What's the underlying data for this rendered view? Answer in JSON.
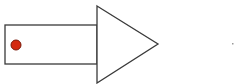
{
  "diagram": {
    "shape": "arrow",
    "colors": {
      "stroke": "#3a3a3a",
      "fill": "#ffffff",
      "dot_fill": "#d42a10",
      "dot_stroke": "#7a1a0a",
      "speck": "#9a9a9a"
    },
    "shaft": {
      "x": 5,
      "y": 25,
      "width": 92,
      "height": 39
    },
    "head": {
      "points": "97,6 158,44 97,83"
    },
    "dot": {
      "cx": 16,
      "cy": 45,
      "r": 5
    },
    "speck": {
      "x": 232,
      "y": 43,
      "width": 1.5,
      "height": 1.5
    }
  }
}
